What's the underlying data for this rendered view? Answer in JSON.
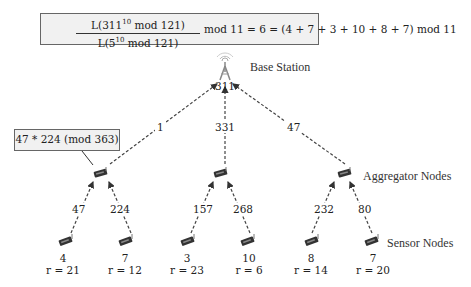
{
  "formula": {
    "numerator": "L(311",
    "numerator_exp": "10",
    "numerator_tail": " mod 121)",
    "denominator": "L(5",
    "denominator_exp": "10",
    "denominator_tail": " mod 121)",
    "rest": "mod 11 = 6 = (4 + 7 + 3 + 10 + 8 + 7) mod 11"
  },
  "base_station": {
    "label": "Base Station",
    "value": "311"
  },
  "edges_to_base": [
    {
      "label": "1"
    },
    {
      "label": "331"
    },
    {
      "label": "47"
    }
  ],
  "callout": "47 * 224 (mod 363)",
  "aggregator_label": "Aggregator Nodes",
  "sensor_label": "Sensor Nodes",
  "aggregators": [
    {
      "edges": [
        "47",
        "224"
      ]
    },
    {
      "edges": [
        "157",
        "268"
      ]
    },
    {
      "edges": [
        "232",
        "80"
      ]
    }
  ],
  "sensors": [
    {
      "value": "4",
      "r": "r = 21"
    },
    {
      "value": "7",
      "r": "r = 12"
    },
    {
      "value": "3",
      "r": "r = 23"
    },
    {
      "value": "10",
      "r": "r = 6"
    },
    {
      "value": "8",
      "r": "r = 14"
    },
    {
      "value": "7",
      "r": "r = 20"
    }
  ]
}
